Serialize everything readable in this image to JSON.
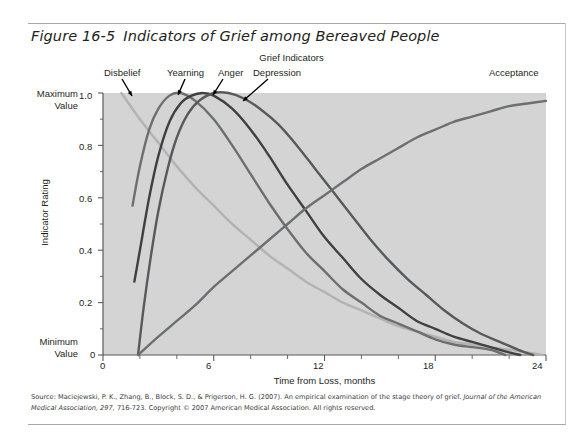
{
  "figure": {
    "number": "Figure 16-5",
    "title": "Indicators of Grief among Bereaved People",
    "chart_heading": "Grief Indicators"
  },
  "axes": {
    "y_axis_title": "Indicator Rating",
    "y_max_label_line1": "Maximum",
    "y_max_label_line2": "Value",
    "y_min_label_line1": "Minimum",
    "y_min_label_line2": "Value",
    "x_axis_title": "Time from Loss, months",
    "y_ticks": [
      "0",
      "0.2",
      "0.4",
      "0.6",
      "0.8",
      "1.0"
    ],
    "x_ticks": [
      "0",
      "6",
      "12",
      "18",
      "24"
    ]
  },
  "series_labels": {
    "disbelief": "Disbelief",
    "yearning": "Yearning",
    "anger": "Anger",
    "depression": "Depression",
    "acceptance": "Acceptance"
  },
  "source": {
    "line1_a": "Source: Maciejewski, P. K., Zhang, B., Block, S. D., & Prigerson, H. G. (2007). An empirical examination of the stage theory of grief. ",
    "line1_italic": "Journal of the American Medical",
    "line2_italic": "Association, 297,",
    "line2_b": " 716-723. Copyright © 2007 American Medical Association. All rights reserved."
  },
  "colors": {
    "plot_background": "#d4d4d4",
    "axis": "#58595b",
    "disbelief": "#b3b3b3",
    "yearning": "#6d6e71",
    "anger": "#404041",
    "depression": "#58595b",
    "acceptance": "#6d6e71",
    "text": "#231f20",
    "rule": "#a7a9ac"
  },
  "chart_data": {
    "type": "line",
    "title": "Grief Indicators",
    "xlabel": "Time from Loss, months",
    "ylabel": "Indicator Rating",
    "xlim": [
      0,
      24
    ],
    "ylim": [
      0,
      1.0
    ],
    "xticks": [
      0,
      6,
      12,
      18,
      24
    ],
    "yticks": [
      0,
      0.2,
      0.4,
      0.6,
      0.8,
      1.0
    ],
    "minor_xtick_step": 2,
    "minor_ytick_step": 0.05,
    "grid": false,
    "legend": "inline-callout-labels",
    "series": [
      {
        "name": "Disbelief",
        "color": "#b3b3b3",
        "points": [
          [
            1.0,
            1.0
          ],
          [
            2.0,
            0.9
          ],
          [
            3.0,
            0.81
          ],
          [
            4.0,
            0.72
          ],
          [
            5.0,
            0.64
          ],
          [
            6.0,
            0.57
          ],
          [
            7.0,
            0.5
          ],
          [
            8.0,
            0.44
          ],
          [
            9.0,
            0.38
          ],
          [
            10.0,
            0.33
          ],
          [
            11.0,
            0.28
          ],
          [
            12.0,
            0.24
          ],
          [
            13.0,
            0.2
          ],
          [
            14.0,
            0.17
          ],
          [
            15.0,
            0.14
          ],
          [
            16.0,
            0.11
          ],
          [
            17.0,
            0.09
          ],
          [
            18.0,
            0.07
          ],
          [
            19.0,
            0.05
          ],
          [
            20.0,
            0.04
          ],
          [
            21.0,
            0.03
          ],
          [
            22.0,
            0.02
          ],
          [
            23.0,
            0.01
          ],
          [
            23.8,
            0.0
          ]
        ]
      },
      {
        "name": "Yearning",
        "color": "#6d6e71",
        "points": [
          [
            1.6,
            0.57
          ],
          [
            2.0,
            0.72
          ],
          [
            2.5,
            0.86
          ],
          [
            3.0,
            0.94
          ],
          [
            3.6,
            0.99
          ],
          [
            4.2,
            1.0
          ],
          [
            5.0,
            0.97
          ],
          [
            6.0,
            0.9
          ],
          [
            7.0,
            0.8
          ],
          [
            8.0,
            0.69
          ],
          [
            9.0,
            0.58
          ],
          [
            10.0,
            0.48
          ],
          [
            11.0,
            0.39
          ],
          [
            12.0,
            0.32
          ],
          [
            13.0,
            0.25
          ],
          [
            14.0,
            0.2
          ],
          [
            15.0,
            0.15
          ],
          [
            16.0,
            0.12
          ],
          [
            17.0,
            0.09
          ],
          [
            18.0,
            0.06
          ],
          [
            19.0,
            0.04
          ],
          [
            20.0,
            0.03
          ],
          [
            21.0,
            0.02
          ],
          [
            21.8,
            0.0
          ]
        ]
      },
      {
        "name": "Anger",
        "color": "#404041",
        "points": [
          [
            1.7,
            0.28
          ],
          [
            2.0,
            0.4
          ],
          [
            2.5,
            0.6
          ],
          [
            3.0,
            0.76
          ],
          [
            3.6,
            0.89
          ],
          [
            4.2,
            0.96
          ],
          [
            4.8,
            0.99
          ],
          [
            5.4,
            1.0
          ],
          [
            6.0,
            0.99
          ],
          [
            7.0,
            0.94
          ],
          [
            8.0,
            0.86
          ],
          [
            9.0,
            0.76
          ],
          [
            10.0,
            0.65
          ],
          [
            11.0,
            0.55
          ],
          [
            12.0,
            0.45
          ],
          [
            13.0,
            0.37
          ],
          [
            14.0,
            0.29
          ],
          [
            15.0,
            0.23
          ],
          [
            16.0,
            0.18
          ],
          [
            17.0,
            0.13
          ],
          [
            18.0,
            0.1
          ],
          [
            19.0,
            0.07
          ],
          [
            20.0,
            0.05
          ],
          [
            21.0,
            0.03
          ],
          [
            22.0,
            0.01
          ],
          [
            22.6,
            0.0
          ]
        ]
      },
      {
        "name": "Depression",
        "color": "#58595b",
        "points": [
          [
            1.9,
            0.0
          ],
          [
            2.2,
            0.18
          ],
          [
            2.6,
            0.38
          ],
          [
            3.0,
            0.55
          ],
          [
            3.5,
            0.71
          ],
          [
            4.0,
            0.83
          ],
          [
            4.6,
            0.92
          ],
          [
            5.2,
            0.97
          ],
          [
            6.0,
            1.0
          ],
          [
            6.8,
            1.0
          ],
          [
            7.6,
            0.98
          ],
          [
            8.5,
            0.94
          ],
          [
            9.5,
            0.88
          ],
          [
            10.5,
            0.8
          ],
          [
            11.5,
            0.71
          ],
          [
            12.5,
            0.62
          ],
          [
            13.5,
            0.53
          ],
          [
            14.5,
            0.44
          ],
          [
            15.5,
            0.36
          ],
          [
            16.5,
            0.29
          ],
          [
            17.5,
            0.23
          ],
          [
            18.5,
            0.17
          ],
          [
            19.5,
            0.12
          ],
          [
            20.5,
            0.08
          ],
          [
            21.5,
            0.05
          ],
          [
            22.5,
            0.02
          ],
          [
            23.3,
            0.0
          ]
        ]
      },
      {
        "name": "Acceptance",
        "color": "#6d6e71",
        "points": [
          [
            1.9,
            0.0
          ],
          [
            3.0,
            0.07
          ],
          [
            4.0,
            0.13
          ],
          [
            5.0,
            0.19
          ],
          [
            6.0,
            0.26
          ],
          [
            7.0,
            0.32
          ],
          [
            8.0,
            0.38
          ],
          [
            9.0,
            0.44
          ],
          [
            10.0,
            0.5
          ],
          [
            11.0,
            0.56
          ],
          [
            12.0,
            0.61
          ],
          [
            13.0,
            0.66
          ],
          [
            14.0,
            0.71
          ],
          [
            15.0,
            0.75
          ],
          [
            16.0,
            0.79
          ],
          [
            17.0,
            0.83
          ],
          [
            18.0,
            0.86
          ],
          [
            19.0,
            0.89
          ],
          [
            20.0,
            0.91
          ],
          [
            21.0,
            0.93
          ],
          [
            22.0,
            0.95
          ],
          [
            23.0,
            0.96
          ],
          [
            24.0,
            0.97
          ]
        ]
      }
    ],
    "annotations": [
      {
        "label": "Disbelief",
        "points_to": [
          1.6,
          0.97
        ]
      },
      {
        "label": "Yearning",
        "points_to": [
          4.2,
          1.0
        ]
      },
      {
        "label": "Anger",
        "points_to": [
          5.4,
          1.0
        ]
      },
      {
        "label": "Depression",
        "points_to": [
          6.6,
          1.0
        ]
      },
      {
        "label": "Acceptance",
        "points_to": [
          24.0,
          0.97
        ]
      }
    ]
  }
}
